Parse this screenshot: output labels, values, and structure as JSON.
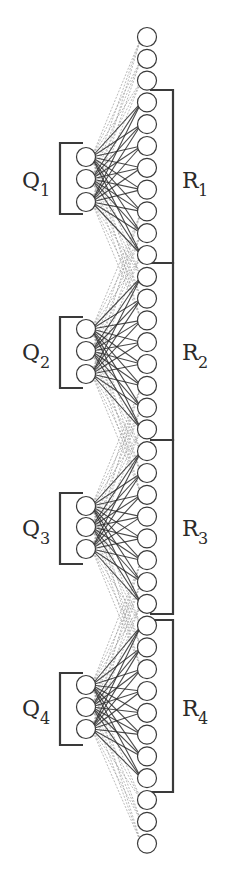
{
  "diagram": {
    "title": "",
    "node_radius": 9.5,
    "right_column": {
      "x": 147,
      "y_start": 37,
      "spacing": 21.8,
      "count": 38,
      "leading_extra_nodes": 3,
      "trailing_extra_nodes": 3
    },
    "groups": [
      {
        "q_label": "Q",
        "q_sub": "1",
        "r_label": "R",
        "r_sub": "1",
        "q_nodes_y": [
          157,
          179,
          202
        ],
        "q_x": 86,
        "q_bracket": {
          "top": 143,
          "bottom": 214,
          "left": 60,
          "right": 83
        },
        "r_first_index": 3,
        "r_bracket": {
          "top": 90,
          "bottom": 263,
          "x": 173,
          "left": 150
        },
        "q_label_pos": {
          "x": 22,
          "y": 188
        },
        "r_label_pos": {
          "x": 182,
          "y": 188
        }
      },
      {
        "q_label": "Q",
        "q_sub": "2",
        "r_label": "R",
        "r_sub": "2",
        "q_nodes_y": [
          329,
          351,
          374
        ],
        "q_x": 86,
        "q_bracket": {
          "top": 317,
          "bottom": 388,
          "left": 60,
          "right": 83
        },
        "r_first_index": 11,
        "r_bracket": {
          "top": 263,
          "bottom": 440,
          "x": 173,
          "left": 150
        },
        "q_label_pos": {
          "x": 22,
          "y": 360
        },
        "r_label_pos": {
          "x": 182,
          "y": 360
        }
      },
      {
        "q_label": "Q",
        "q_sub": "3",
        "r_label": "R",
        "r_sub": "3",
        "q_nodes_y": [
          506,
          527,
          549
        ],
        "q_x": 86,
        "q_bracket": {
          "top": 493,
          "bottom": 564,
          "left": 60,
          "right": 83
        },
        "r_first_index": 19,
        "r_bracket": {
          "top": 440,
          "bottom": 614,
          "x": 173,
          "left": 150
        },
        "q_label_pos": {
          "x": 22,
          "y": 536
        },
        "r_label_pos": {
          "x": 182,
          "y": 536
        }
      },
      {
        "q_label": "Q",
        "q_sub": "4",
        "r_label": "R",
        "r_sub": "4",
        "q_nodes_y": [
          685,
          707,
          729
        ],
        "q_x": 86,
        "q_bracket": {
          "top": 673,
          "bottom": 745,
          "left": 60,
          "right": 83
        },
        "r_first_index": 27,
        "r_bracket": {
          "top": 620,
          "bottom": 792,
          "x": 173,
          "left": 150
        },
        "q_label_pos": {
          "x": 22,
          "y": 716
        },
        "r_label_pos": {
          "x": 182,
          "y": 716
        }
      }
    ],
    "group_size": 8,
    "receptive_overlap": 3,
    "colors": {
      "strong_edge": "#2b2b2b",
      "weak_edge": "#9a9a9a",
      "node_stroke": "#3a3a3a",
      "node_fill": "#ffffff",
      "bracket": "#3a3a3a"
    }
  }
}
